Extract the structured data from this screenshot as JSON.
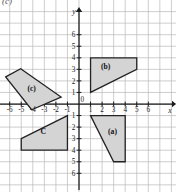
{
  "figure": {
    "corner_label": "(c)",
    "axis_x_name": "x",
    "axis_y_name": "y",
    "grid": "on",
    "origin_label": "0"
  },
  "chart_data": {
    "type": "scatter",
    "title": "",
    "xlabel": "x",
    "ylabel": "y",
    "xlim": [
      -7,
      7
    ],
    "ylim": [
      -7,
      7
    ],
    "grid": true,
    "legend": "none",
    "x_ticks": [
      "-6",
      "-5",
      "-4",
      "-3",
      "-2",
      "-1",
      "0",
      "1",
      "2",
      "3",
      "4",
      "5",
      "6"
    ],
    "x_tick_values": [
      -6,
      -5,
      -4,
      -3,
      -2,
      -1,
      0,
      1,
      2,
      3,
      4,
      5,
      6
    ],
    "y_ticks_positive": [
      "1",
      "2",
      "3",
      "4",
      "5",
      "6"
    ],
    "y_tick_values_positive": [
      1,
      2,
      3,
      4,
      5,
      6
    ],
    "y_ticks_negative": [
      "1",
      "2",
      "3",
      "4",
      "5",
      "6"
    ],
    "y_tick_values_negative": [
      -1,
      -2,
      -3,
      -4,
      -5,
      -6
    ],
    "shapes": [
      {
        "label": "(a)",
        "label_point": [
          2.9,
          -2.6
        ],
        "vertices": [
          [
            1,
            -1
          ],
          [
            4,
            -1
          ],
          [
            4,
            -5
          ],
          [
            3,
            -5
          ]
        ],
        "fill": "#d4d4d4",
        "stroke": "#222222"
      },
      {
        "label": "(b)",
        "label_point": [
          2.3,
          3.0
        ],
        "vertices": [
          [
            1,
            1
          ],
          [
            1,
            4
          ],
          [
            5,
            4
          ],
          [
            5,
            3
          ]
        ],
        "fill": "#d4d4d4",
        "stroke": "#222222"
      },
      {
        "label": "(c)",
        "label_point": [
          -4.1,
          1.1
        ],
        "vertices": [
          [
            -6.35,
            2.35
          ],
          [
            -5.05,
            3.05
          ],
          [
            -1.55,
            0.6
          ],
          [
            -4.1,
            -0.5
          ]
        ],
        "fill": "#d4d4d4",
        "stroke": "#222222"
      },
      {
        "label": "C",
        "label_point": [
          -3.1,
          -2.6
        ],
        "vertices": [
          [
            -5,
            -3
          ],
          [
            -1,
            -1
          ],
          [
            -1,
            -4
          ],
          [
            -5,
            -4
          ]
        ],
        "fill": "#d4d4d4",
        "stroke": "#222222"
      }
    ],
    "colors": {
      "grid_line": "#b9b9b9",
      "axis": "#1a1a1a",
      "shape_fill": "#d4d4d4",
      "shape_stroke": "#222222"
    }
  }
}
